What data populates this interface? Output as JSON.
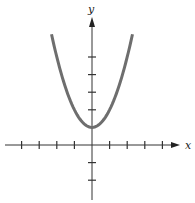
{
  "chart_data": {
    "type": "line",
    "title": "",
    "xlabel": "x",
    "ylabel": "y",
    "function": "y = x^2 + 1",
    "series": [
      {
        "name": "parabola",
        "color": "#6e6e6e",
        "x": [
          -2.3,
          -2.0,
          -1.5,
          -1.0,
          -0.5,
          0,
          0.5,
          1.0,
          1.5,
          2.0,
          2.3
        ],
        "y": [
          6.29,
          5.0,
          3.25,
          2.0,
          1.25,
          1.0,
          1.25,
          2.0,
          3.25,
          5.0,
          6.29
        ]
      }
    ],
    "xlim": [
      -5,
      5
    ],
    "ylim": [
      -3,
      8
    ],
    "x_ticks": [
      -4,
      -3,
      -2,
      -1,
      1,
      2,
      3,
      4
    ],
    "y_ticks": [
      -2,
      -1,
      1,
      2,
      3,
      4,
      5
    ],
    "tick_labels_shown": false,
    "grid": false,
    "legend": "none",
    "vertex": [
      0,
      1
    ]
  },
  "layout": {
    "origin_px": [
      92,
      145
    ],
    "unit_px": 17.6,
    "x_axis_left_px": 5,
    "x_axis_right_px": 180,
    "y_axis_top_px": 17,
    "y_axis_bottom_px": 200
  },
  "labels": {
    "x": "x",
    "y": "y"
  }
}
